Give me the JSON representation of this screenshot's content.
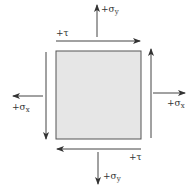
{
  "diagram": {
    "title": "",
    "element": {
      "fill": "#e6e6e6",
      "stroke": "#555555"
    },
    "arrow_color": "#333333",
    "labels": {
      "tau_top": {
        "sign": "+",
        "symbol": "τ"
      },
      "tau_bottom": {
        "sign": "+",
        "symbol": "τ"
      },
      "sigma_y_top": {
        "sign": "+",
        "symbol": "σ",
        "subscript": "y"
      },
      "sigma_y_bottom": {
        "sign": "+",
        "symbol": "σ",
        "subscript": "y"
      },
      "sigma_x_left": {
        "sign": "+",
        "symbol": "σ",
        "subscript": "x"
      },
      "sigma_x_right": {
        "sign": "+",
        "symbol": "σ",
        "subscript": "x"
      }
    }
  }
}
